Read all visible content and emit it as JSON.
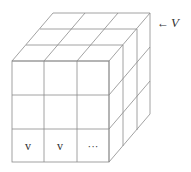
{
  "diagram": {
    "type": "3x3x3 cube grid",
    "front_face": {
      "x0": 12,
      "y0": 61,
      "x1": 109,
      "y1": 162,
      "cols": 3,
      "rows": 3
    },
    "depth_offset": {
      "dx": 41,
      "dy": -48
    },
    "line_color": "#8a8a8a",
    "cells": [
      {
        "row": 2,
        "col": 0,
        "label": "v"
      },
      {
        "row": 2,
        "col": 1,
        "label": "v"
      },
      {
        "row": 2,
        "col": 2,
        "label": "···"
      }
    ],
    "pointer": {
      "arrow": "←",
      "label": "V"
    }
  }
}
